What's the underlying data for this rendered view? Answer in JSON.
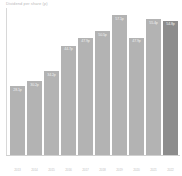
{
  "chart_data": {
    "type": "bar",
    "title": "Dividend per share (p)",
    "xlabel": "",
    "ylabel": "",
    "ylim": [
      0,
      60
    ],
    "grid": false,
    "legend": "none",
    "categories": [
      "2013",
      "2014",
      "2015",
      "2016",
      "2017",
      "2018",
      "2019",
      "2020",
      "2021",
      "2022"
    ],
    "values": [
      28.1,
      30.2,
      34.2,
      44.7,
      47.9,
      50.5,
      57.1,
      47.9,
      55.4,
      54.8
    ],
    "value_labels": [
      "28.1p",
      "30.2p",
      "34.2p",
      "44.7p",
      "47.9p",
      "50.5p",
      "57.1p",
      "47.9p",
      "55.4p",
      "54.8p"
    ],
    "highlight_index": 9,
    "colors": {
      "bar": "#b3b3b3",
      "bar_highlight": "#8c8c8c",
      "label_text": "#f2f2f2",
      "axis": "#d8d8d8",
      "tick_text": "#c4c4c4",
      "background": "#ffffff"
    }
  }
}
